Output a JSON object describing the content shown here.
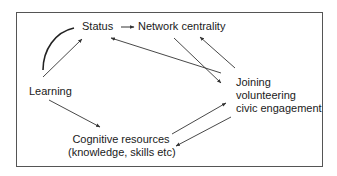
{
  "diagram": {
    "type": "flow",
    "nodes": [
      {
        "id": "status",
        "label": "Status"
      },
      {
        "id": "network",
        "label": "Network centrality"
      },
      {
        "id": "learning",
        "label": "Learning"
      },
      {
        "id": "joining",
        "lines": [
          "Joining",
          "volunteering",
          "civic engagement"
        ]
      },
      {
        "id": "cognitive",
        "lines": [
          "Cognitive resources",
          "(knowledge, skills etc)"
        ]
      }
    ],
    "edges": [
      {
        "from": "status",
        "to": "network",
        "style": "short-arrow"
      },
      {
        "from": "learning",
        "to": "status",
        "style": "arrow"
      },
      {
        "from": "learning",
        "to": "status",
        "style": "curve-no-arrowhead"
      },
      {
        "from": "joining",
        "to": "status",
        "style": "arrow"
      },
      {
        "from": "network",
        "to": "joining",
        "style": "arrow"
      },
      {
        "from": "joining",
        "to": "network",
        "style": "arrow"
      },
      {
        "from": "learning",
        "to": "cognitive",
        "style": "arrow"
      },
      {
        "from": "cognitive",
        "to": "joining",
        "style": "arrow"
      },
      {
        "from": "joining",
        "to": "cognitive",
        "style": "arrow"
      }
    ]
  },
  "colors": {
    "line": "#333333",
    "frame": "#555555",
    "text": "#1a1a1a",
    "background": "#ffffff"
  }
}
